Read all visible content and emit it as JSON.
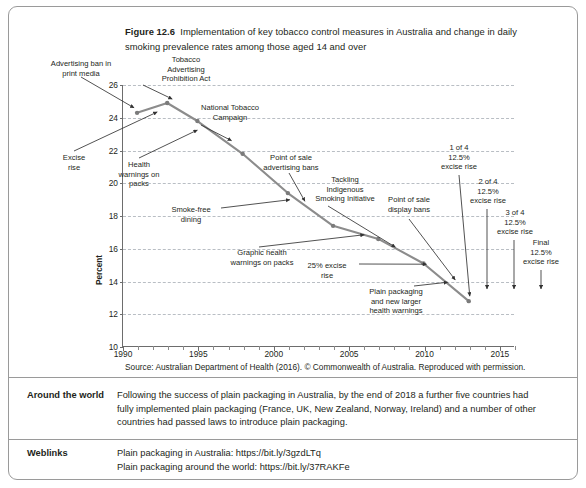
{
  "figure": {
    "number": "Figure 12.6",
    "caption": "Implementation of key tobacco control measures in Australia and change in daily smoking prevalence rates among those aged 14 and over"
  },
  "source": "Source: Australian Department of Health (2016). © Commonwealth of Australia. Reproduced with permission.",
  "rows": [
    {
      "label": "Around the world",
      "lines": [
        "Following the success of plain packaging in Australia, by the end of 2018 a further five countries had",
        "fully implemented plain packaging (France, UK, New Zealand, Norway, Ireland) and a number of other",
        "countries had passed laws to introduce plain packaging."
      ]
    },
    {
      "label": "Weblinks",
      "lines": [
        "Plain packaging in Australia: https://bit.ly/3gzdLTq",
        "Plain packaging around the world: https://bit.ly/37RAKFe"
      ]
    }
  ],
  "chart_data": {
    "type": "line",
    "title": "Implementation of key tobacco control measures in Australia and change in daily smoking prevalence rates among those aged 14 and over",
    "xlabel": "",
    "ylabel": "Percent",
    "xlim": [
      1990,
      2016
    ],
    "ylim": [
      10,
      26
    ],
    "ytick_labels": [
      "10",
      "12",
      "14",
      "16",
      "18",
      "20",
      "22",
      "24",
      "26"
    ],
    "yticks": [
      10,
      12,
      14,
      16,
      18,
      20,
      22,
      24,
      26
    ],
    "xtick_labels": [
      "1990",
      "1995",
      "2000",
      "2005",
      "2010",
      "2015"
    ],
    "xticks": [
      1990,
      1995,
      2000,
      2005,
      2010,
      2015
    ],
    "grid": "horizontal-dashed",
    "legend": "none",
    "series": [
      {
        "name": "Daily smoking prevalence, aged 14 and over",
        "color": "#8c8c8c",
        "x": [
          1991,
          1993,
          1995,
          1998,
          2001,
          2004,
          2007,
          2010,
          2013
        ],
        "values": [
          24.3,
          24.9,
          23.8,
          21.8,
          19.4,
          17.4,
          16.6,
          15.1,
          12.8
        ]
      }
    ],
    "annotations": [
      {
        "text": "Advertising ban in\nprint media",
        "target_x": 1991,
        "target_y": 24.3
      },
      {
        "text": "Excise\nrise",
        "target_x": 1993,
        "target_y": 24.9
      },
      {
        "text": "Tobacco\nAdvertising\nProhibition Act",
        "target_x": 1993,
        "target_y": 24.9
      },
      {
        "text": "Health\nwarnings on\npacks",
        "target_x": 1995,
        "target_y": 23.8
      },
      {
        "text": "National Tobacco\nCampaign",
        "target_x": 1997,
        "target_y": 22.3
      },
      {
        "text": "Point of sale\nadvertising bans",
        "target_x": 2002,
        "target_y": 18.8
      },
      {
        "text": "Smoke-free\ndining",
        "target_x": 2001,
        "target_y": 19.4
      },
      {
        "text": "Graphic health\nwarnings on packs",
        "target_x": 2006,
        "target_y": 17.0
      },
      {
        "text": "Tackling\nIndigenous\nSmoking Initiative",
        "target_x": 2008,
        "target_y": 16.2
      },
      {
        "text": "25% excise\nrise",
        "target_x": 2010,
        "target_y": 15.1
      },
      {
        "text": "Point of sale\ndisplay bans",
        "target_x": 2012,
        "target_y": 13.8
      },
      {
        "text": "Plain packaging\nand new larger\nhealth warnings",
        "target_x": 2012,
        "target_y": 13.9
      },
      {
        "text": "1 of 4\n12.5%\nexcise rise",
        "target_x": 2013,
        "target_y": 12.8
      },
      {
        "text": "2 of 4\n12.5%\nexcise rise",
        "target_x": 2014,
        "target_y": 12.8
      },
      {
        "text": "3 of 4\n12.5%\nexcise rise",
        "target_x": 2015,
        "target_y": 12.8
      },
      {
        "text": "Final\n12.5%\nexcise rise",
        "target_x": 2016,
        "target_y": 12.8
      }
    ]
  }
}
